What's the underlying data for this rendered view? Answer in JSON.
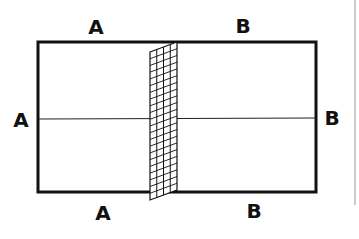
{
  "diagram": {
    "title": "",
    "type": "court-with-net",
    "colors": {
      "line": "#111111",
      "background": "#ffffff",
      "edge_rule": "#9a9a9a"
    },
    "labels": {
      "top_left": "A",
      "top_right": "B",
      "left": "A",
      "right": "B",
      "bottom_left": "A",
      "bottom_right": "B"
    },
    "court": {
      "x": 38,
      "y": 42,
      "width": 278,
      "height": 150
    },
    "center_line_y": 119,
    "net": {
      "top_left": [
        150,
        52
      ],
      "top_right": [
        177,
        42
      ],
      "bottom_right": [
        177,
        190
      ],
      "bottom_left": [
        150,
        200
      ],
      "columns": 4,
      "rows": 22
    }
  }
}
